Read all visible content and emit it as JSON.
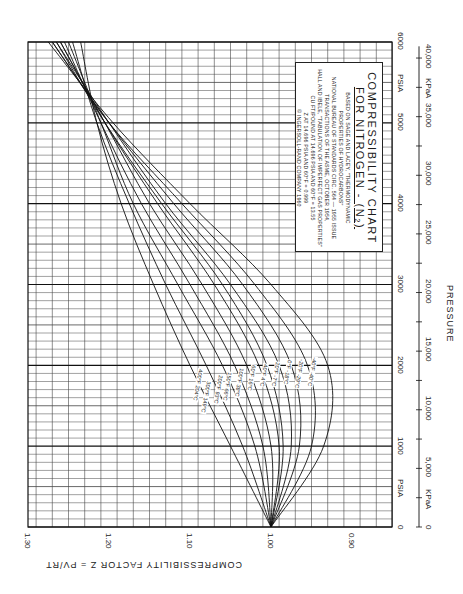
{
  "chart_data": {
    "type": "line",
    "orientation": "rotated-90-clockwise",
    "title": "COMPRESSIBILITY CHART",
    "subtitle": "FOR NITROGEN - (N2)",
    "notes": [
      "BASED ON SAGE AND LACEY, \"THERMODYNAMIC",
      "PROPERTIES OF HYDROCARBONS\"",
      "NATIONAL BUREAU OF STANDARDS CIRC. 564 — 1955 ISSUE",
      "TRANSACTIONS OF THE ASME, OCTOBER 1954,",
      "HALL AND IBELE, \"TABULATION OF IMPERFECT GAS PROPERTIES\"",
      "CU FT/POUND AT 14.696 PSIA AND 60°F = 13.55",
      "Z AT 14.696 PSIA AND 60°F = 0.999",
      "© INGERSOLL-RAND COMPANY 1960"
    ],
    "xlabel": "PRESSURE",
    "x_unit_primary": "PSIA",
    "x_unit_secondary": "KPaA",
    "ylabel": "COMPRESSIBILITY FACTOR Z = PV/RT",
    "xlim": [
      0,
      6000
    ],
    "ylim": [
      0.85,
      1.3
    ],
    "x_ticks_psia": [
      "0",
      "1000",
      "2000",
      "3000",
      "4000",
      "5000",
      "6000"
    ],
    "x_ticks_kpa": [
      "0",
      "5,000",
      "10,000",
      "15,000",
      "20,000",
      "25,000",
      "30,000",
      "35,000",
      "40,000"
    ],
    "y_ticks": [
      "1.30",
      "1.20",
      "1.10",
      "1.00",
      "0.90"
    ],
    "grid": true,
    "x": [
      0,
      1000,
      2000,
      3000,
      4000,
      5000,
      6000
    ],
    "series": [
      {
        "name": "400°F 204°C",
        "values": [
          1.0,
          1.05,
          1.1,
          1.145,
          1.185,
          1.215,
          1.235
        ]
      },
      {
        "name": "300°F 149°C",
        "values": [
          1.0,
          1.035,
          1.08,
          1.13,
          1.175,
          1.215,
          1.245
        ]
      },
      {
        "name": "200°F 93°C",
        "values": [
          1.0,
          1.02,
          1.06,
          1.115,
          1.17,
          1.21,
          1.25
        ]
      },
      {
        "name": "150°F 66°C",
        "values": [
          1.0,
          1.01,
          1.045,
          1.1,
          1.16,
          1.21,
          1.255
        ]
      },
      {
        "name": "100°F 38°C",
        "values": [
          1.0,
          1.0,
          1.03,
          1.085,
          1.15,
          1.205,
          1.26
        ]
      },
      {
        "name": "60°F 16°C",
        "values": [
          1.0,
          0.99,
          1.015,
          1.07,
          1.14,
          1.205,
          1.26
        ]
      },
      {
        "name": "40°F 4°C",
        "values": [
          1.0,
          0.985,
          1.005,
          1.06,
          1.135,
          1.205,
          1.265
        ]
      },
      {
        "name": "20°F -7°C",
        "values": [
          1.0,
          0.975,
          0.99,
          1.05,
          1.13,
          1.2,
          1.265
        ]
      },
      {
        "name": "0°F -18°C",
        "values": [
          1.0,
          0.965,
          0.975,
          1.035,
          1.12,
          1.2,
          1.27
        ]
      },
      {
        "name": "-20°F -29°C",
        "values": [
          1.0,
          0.95,
          0.955,
          1.02,
          1.11,
          1.2,
          1.27
        ]
      },
      {
        "name": "-40°F -40°C",
        "values": [
          1.0,
          0.935,
          0.93,
          1.0,
          1.1,
          1.195,
          1.275
        ]
      }
    ],
    "legend_position": "inline-labels"
  },
  "labels": {
    "title_main": "COMPRESSIBILITY CHART",
    "title_sub": "FOR NITROGEN - (N₂)",
    "psia_top": "PSIA",
    "psia_bottom": "PSIA",
    "kpa_unit": "KPaA",
    "pressure": "PRESSURE",
    "y_title": "COMPRESSIBILITY FACTOR Z = PV/RT"
  },
  "colors": {
    "ink": "#1a1a1a",
    "grid_minor": "#555555",
    "paper": "#ffffff"
  }
}
